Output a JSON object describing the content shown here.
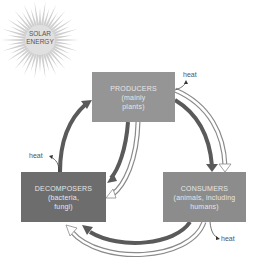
{
  "sun": {
    "label_line1": "SOLAR",
    "label_line2": "ENERGY"
  },
  "nodes": {
    "producers": {
      "title": "PRODUCERS",
      "line1": "(mainly",
      "line2": "plants)"
    },
    "decomposers": {
      "title": "DECOMPOSERS",
      "line1": "(bacteria,",
      "line2": "fungi)"
    },
    "consumers": {
      "title": "CONSUMERS",
      "line1": "(animals, including",
      "line2": "humans)"
    }
  },
  "heat_labels": {
    "producers": "heat",
    "decomposers": "heat",
    "consumers": "heat"
  },
  "legend": {
    "dark_arrow": "chemical nutrients",
    "light_arrow": "energy flow"
  },
  "colors": {
    "dark_arrow": "#5a5a5a",
    "light_arrow_fill": "#ffffff",
    "light_arrow_stroke": "#8a8a8a",
    "producers_fill": "#959595",
    "decomposers_fill": "#6d6d6d",
    "consumers_fill": "#8c8c8c"
  }
}
